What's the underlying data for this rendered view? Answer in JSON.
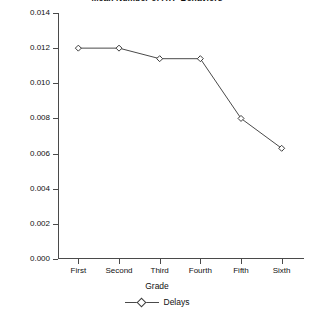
{
  "chart_data": {
    "type": "line",
    "title": "Mean Number of ATP Behaviors",
    "xlabel": "Grade",
    "ylabel": "",
    "categories": [
      "First",
      "Second",
      "Third",
      "Fourth",
      "Fifth",
      "Sixth"
    ],
    "series": [
      {
        "name": "Delays",
        "values": [
          0.012,
          0.012,
          0.0114,
          0.0114,
          0.008,
          0.0063
        ],
        "marker": "open-diamond",
        "color": "#3c3c3c"
      }
    ],
    "ylim": [
      0.0,
      0.014
    ],
    "ytick_step": 0.002,
    "ytick_labels": [
      "0.000",
      "0.002",
      "0.004",
      "0.006",
      "0.008",
      "0.010",
      "0.012",
      "0.014"
    ],
    "ytick_values": [
      0.0,
      0.002,
      0.004,
      0.006,
      0.008,
      0.01,
      0.012,
      0.014
    ],
    "grid": false,
    "legend_position": "bottom",
    "legend_entries": [
      "Delays"
    ]
  },
  "legend": {
    "label": "Delays"
  },
  "axis": {
    "x_title": "Grade"
  }
}
